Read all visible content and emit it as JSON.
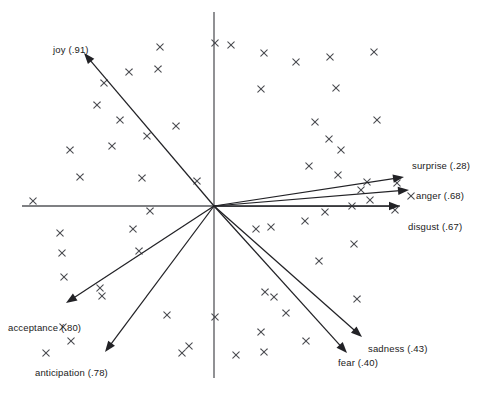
{
  "figure": {
    "width": 482,
    "height": 401,
    "background": "#ffffff",
    "axis_color": "#55565a",
    "point_color": "#4a4b50",
    "vector_color": "#222226",
    "label_color": "#1a1a1a"
  },
  "chart_data": {
    "type": "scatter",
    "title": "",
    "subtitle": "",
    "xlabel": "",
    "ylabel": "",
    "grid": false,
    "legend_position": "none",
    "axes": {
      "origin_px": [
        214,
        206
      ],
      "horizontal_axis_px": [
        22,
        206,
        400,
        206
      ],
      "vertical_axis_px": [
        214,
        12,
        214,
        378
      ],
      "x_tick_labels": [],
      "y_tick_labels": [],
      "xlim": [],
      "ylim": []
    },
    "annotations": [
      "joy (.91)",
      "surprise (.28)",
      "anger (.68)",
      "disgust (.67)",
      "sadness (.43)",
      "fear (.40)",
      "anticipation (.78)",
      "acceptance (.80)"
    ],
    "vectors": [
      {
        "name": "joy",
        "label": "joy (.91)",
        "loading": 0.91,
        "tip_px": [
          84,
          53
        ],
        "label_px": [
          53,
          44
        ],
        "label_anchor": "start"
      },
      {
        "name": "surprise",
        "label": "surprise (.28)",
        "loading": 0.28,
        "tip_px": [
          404,
          177
        ],
        "label_px": [
          412,
          160
        ],
        "label_anchor": "start"
      },
      {
        "name": "anger",
        "label": "anger (.68)",
        "loading": 0.68,
        "tip_px": [
          409,
          190
        ],
        "label_px": [
          416,
          190
        ],
        "label_anchor": "start"
      },
      {
        "name": "disgust",
        "label": "disgust (.67)",
        "loading": 0.67,
        "tip_px": [
          400,
          206
        ],
        "label_px": [
          408,
          221
        ],
        "label_anchor": "start"
      },
      {
        "name": "sadness",
        "label": "sadness (.43)",
        "loading": 0.43,
        "tip_px": [
          362,
          337
        ],
        "label_px": [
          368,
          343
        ],
        "label_anchor": "start"
      },
      {
        "name": "fear",
        "label": "fear (.40)",
        "loading": 0.4,
        "tip_px": [
          347,
          353
        ],
        "label_px": [
          338,
          357
        ],
        "label_anchor": "start"
      },
      {
        "name": "anticipation",
        "label": "anticipation (.78)",
        "loading": 0.78,
        "tip_px": [
          105,
          352
        ],
        "label_px": [
          35,
          367
        ],
        "label_anchor": "start"
      },
      {
        "name": "acceptance",
        "label": "acceptance (.80)",
        "loading": 0.8,
        "tip_px": [
          66,
          303
        ],
        "label_px": [
          8,
          322
        ],
        "label_anchor": "start"
      }
    ],
    "points_px": [
      [
        160,
        47
      ],
      [
        215,
        43
      ],
      [
        231,
        45
      ],
      [
        264,
        53
      ],
      [
        158,
        69
      ],
      [
        104,
        83
      ],
      [
        129,
        72
      ],
      [
        296,
        62
      ],
      [
        330,
        57
      ],
      [
        374,
        52
      ],
      [
        97,
        105
      ],
      [
        120,
        120
      ],
      [
        176,
        126
      ],
      [
        261,
        89
      ],
      [
        336,
        88
      ],
      [
        112,
        146
      ],
      [
        147,
        136
      ],
      [
        70,
        150
      ],
      [
        315,
        122
      ],
      [
        377,
        120
      ],
      [
        80,
        177
      ],
      [
        142,
        178
      ],
      [
        197,
        181
      ],
      [
        329,
        139
      ],
      [
        341,
        150
      ],
      [
        33,
        201
      ],
      [
        309,
        166
      ],
      [
        338,
        175
      ],
      [
        367,
        182
      ],
      [
        361,
        190
      ],
      [
        397,
        183
      ],
      [
        370,
        200
      ],
      [
        150,
        211
      ],
      [
        271,
        227
      ],
      [
        305,
        221
      ],
      [
        256,
        229
      ],
      [
        133,
        229
      ],
      [
        139,
        251
      ],
      [
        60,
        233
      ],
      [
        62,
        253
      ],
      [
        64,
        277
      ],
      [
        325,
        212
      ],
      [
        354,
        244
      ],
      [
        319,
        261
      ],
      [
        100,
        288
      ],
      [
        102,
        296
      ],
      [
        352,
        206
      ],
      [
        265,
        292
      ],
      [
        274,
        297
      ],
      [
        286,
        313
      ],
      [
        167,
        315
      ],
      [
        215,
        317
      ],
      [
        261,
        332
      ],
      [
        306,
        341
      ],
      [
        189,
        346
      ],
      [
        236,
        355
      ],
      [
        264,
        352
      ],
      [
        357,
        299
      ],
      [
        395,
        210
      ],
      [
        182,
        353
      ],
      [
        63,
        327
      ],
      [
        71,
        341
      ],
      [
        46,
        353
      ],
      [
        411,
        196
      ]
    ]
  }
}
